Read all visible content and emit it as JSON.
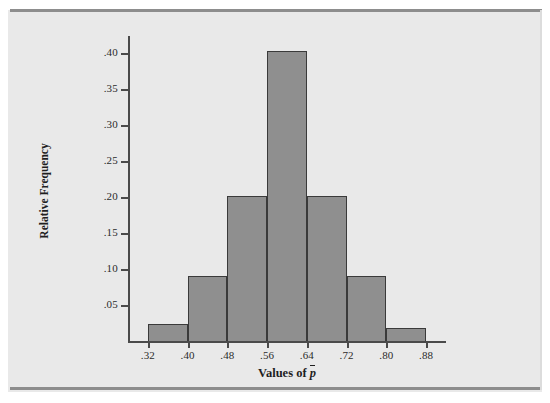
{
  "figure": {
    "panel_background": "#e9e9e9",
    "rule_color": "#8d8d8d"
  },
  "chart_data": {
    "type": "bar",
    "title": "",
    "subtitle": "",
    "xlabel": "Values of p̄",
    "xlabel_text": "Values of ",
    "xlabel_symbol": "p",
    "ylabel": "Relative Frequency",
    "categories": [
      ".32-.40",
      ".40-.48",
      ".48-.56",
      ".56-.64",
      ".64-.72",
      ".72-.80",
      ".80-.88"
    ],
    "bin_edges": [
      0.32,
      0.4,
      0.48,
      0.56,
      0.64,
      0.72,
      0.8,
      0.88
    ],
    "values": [
      0.023,
      0.09,
      0.201,
      0.403,
      0.201,
      0.09,
      0.018
    ],
    "bar_fill_color": "#8f8f8f",
    "bar_edge_color": "#3a3a3a",
    "xlim": [
      0.28,
      0.92
    ],
    "ylim": [
      0.0,
      0.425
    ],
    "grid": false,
    "legend": false,
    "x_ticks": [
      0.32,
      0.4,
      0.48,
      0.56,
      0.64,
      0.72,
      0.8,
      0.88
    ],
    "x_tick_labels": [
      ".32",
      ".40",
      ".48",
      ".56",
      ".64",
      ".72",
      ".80",
      ".88"
    ],
    "y_ticks": [
      0.05,
      0.1,
      0.15,
      0.2,
      0.25,
      0.3,
      0.35,
      0.4
    ],
    "y_tick_labels": [
      ".05",
      ".10",
      ".15",
      ".20",
      ".25",
      ".30",
      ".35",
      ".40"
    ]
  }
}
